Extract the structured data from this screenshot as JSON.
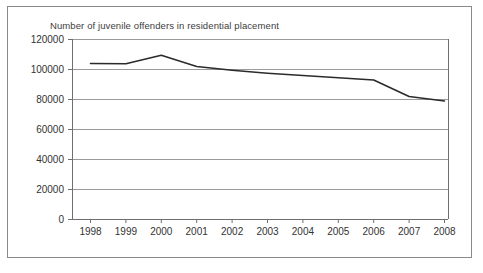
{
  "chart_data": {
    "type": "line",
    "title": "Number of juvenile offenders in residential placement",
    "xlabel": "",
    "ylabel": "",
    "categories": [
      "1998",
      "1999",
      "2000",
      "2001",
      "2002",
      "2003",
      "2004",
      "2005",
      "2006",
      "2007",
      "2008"
    ],
    "x": [
      1998,
      1999,
      2000,
      2001,
      2002,
      2003,
      2004,
      2005,
      2006,
      2007,
      2008
    ],
    "series": [
      {
        "name": "Juvenile offenders in residential placement",
        "values": [
          104000,
          103800,
          109500,
          102000,
          99500,
          97500,
          96000,
          94500,
          93000,
          82000,
          79000
        ]
      }
    ],
    "ylim": [
      0,
      120000
    ],
    "yticks": [
      0,
      20000,
      40000,
      60000,
      80000,
      100000,
      120000
    ],
    "ytick_labels": [
      "0",
      "20000",
      "40000",
      "60000",
      "80000",
      "100000",
      "120000"
    ],
    "xtick_labels": [
      "1998",
      "1999",
      "2000",
      "2001",
      "2002",
      "2003",
      "2004",
      "2005",
      "2006",
      "2007",
      "2008"
    ],
    "grid": true,
    "grid_axis": "y",
    "legend": false,
    "legend_position": "none",
    "line_color": "#2b2b2b",
    "grid_color": "#8f8f8f",
    "background_color": "#ffffff",
    "frame_color": "#8a8a8a"
  }
}
